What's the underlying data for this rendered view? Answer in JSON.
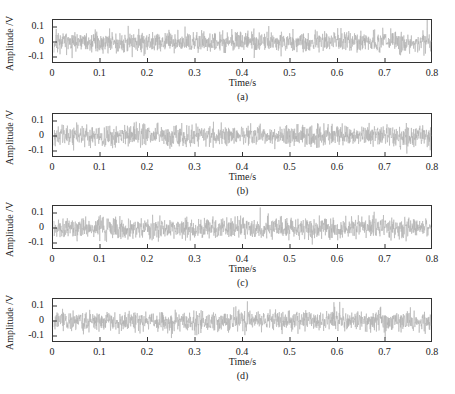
{
  "chart_data": [
    {
      "type": "line",
      "caption": "(a)",
      "xlabel": "Time/s",
      "ylabel": "Amplitude /V",
      "xlim": [
        0,
        0.8
      ],
      "ylim": [
        -0.15,
        0.15
      ],
      "xticks": [
        "0",
        "0.1",
        "0.2",
        "0.3",
        "0.4",
        "0.5",
        "0.6",
        "0.7",
        "0.8"
      ],
      "yticks": [
        "0.1",
        "0",
        "-0.1"
      ],
      "series": [
        {
          "name": "signal a",
          "color": "#b0b0b0",
          "description": "random noise-like vibration signal",
          "amplitude_range": [
            -0.11,
            0.15
          ],
          "seed": 11
        }
      ],
      "grid": false
    },
    {
      "type": "line",
      "caption": "(b)",
      "xlabel": "Time/s",
      "ylabel": "Amplitude /V",
      "xlim": [
        0,
        0.8
      ],
      "ylim": [
        -0.15,
        0.15
      ],
      "xticks": [
        "0",
        "0.1",
        "0.2",
        "0.3",
        "0.4",
        "0.5",
        "0.6",
        "0.7",
        "0.8"
      ],
      "yticks": [
        "0.1",
        "0",
        "-0.1"
      ],
      "series": [
        {
          "name": "signal b",
          "color": "#b0b0b0",
          "description": "random noise-like vibration signal",
          "amplitude_range": [
            -0.12,
            0.13
          ],
          "seed": 23
        }
      ],
      "grid": false
    },
    {
      "type": "line",
      "caption": "(c)",
      "xlabel": "Time/s",
      "ylabel": "Amplitude /V",
      "xlim": [
        0,
        0.8
      ],
      "ylim": [
        -0.15,
        0.15
      ],
      "xticks": [
        "0",
        "0.1",
        "0.2",
        "0.3",
        "0.4",
        "0.5",
        "0.6",
        "0.7",
        "0.8"
      ],
      "yticks": [
        "0.1",
        "0",
        "-0.1"
      ],
      "series": [
        {
          "name": "signal c",
          "color": "#b0b0b0",
          "description": "random noise-like vibration signal",
          "amplitude_range": [
            -0.13,
            0.14
          ],
          "seed": 37
        }
      ],
      "grid": false
    },
    {
      "type": "line",
      "caption": "(d)",
      "xlabel": "Time/s",
      "ylabel": "Amplitude /V",
      "xlim": [
        0,
        0.8
      ],
      "ylim": [
        -0.15,
        0.15
      ],
      "xticks": [
        "0",
        "0.1",
        "0.2",
        "0.3",
        "0.4",
        "0.5",
        "0.6",
        "0.7",
        "0.8"
      ],
      "yticks": [
        "0.1",
        "0",
        "-0.1"
      ],
      "series": [
        {
          "name": "signal d",
          "color": "#b0b0b0",
          "description": "random noise-like vibration signal",
          "amplitude_range": [
            -0.13,
            0.15
          ],
          "seed": 53
        }
      ],
      "grid": false
    }
  ],
  "panels": [
    {
      "top": 19
    },
    {
      "top": 113
    },
    {
      "top": 205
    },
    {
      "top": 298
    }
  ]
}
